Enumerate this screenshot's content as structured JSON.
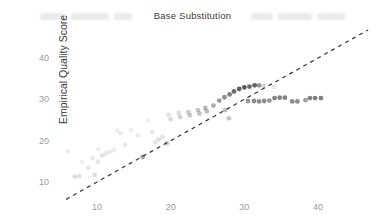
{
  "header": {
    "title": "Base Substitution"
  },
  "axes": {
    "ylabel": "Empirical Quality Score",
    "xlabel": ""
  },
  "colors": {
    "point": "#2f2f2f",
    "identity_line": "#333333",
    "tick_label": "#9a9a9a",
    "title_text": "#3d3d3d",
    "background": "#ffffff"
  },
  "chart_data": {
    "type": "scatter",
    "title": "Base Substitution",
    "xlabel": "",
    "ylabel": "Empirical Quality Score",
    "x_ticks": [
      10,
      20,
      30,
      40
    ],
    "y_ticks": [
      10,
      20,
      30,
      40
    ],
    "xlim": [
      4.5,
      49
    ],
    "ylim": [
      4,
      47
    ],
    "grid": false,
    "legend": "none",
    "identity_line": {
      "style": "dashed",
      "from": [
        5.8,
        5.8
      ],
      "to": [
        46.8,
        46.8
      ]
    },
    "points_format": [
      "predicted_quality",
      "empirical_quality",
      "alpha"
    ],
    "points": [
      [
        6.0,
        17.4,
        0.1
      ],
      [
        7.0,
        11.3,
        0.16
      ],
      [
        7.6,
        11.4,
        0.13
      ],
      [
        8.0,
        14.8,
        0.08
      ],
      [
        8.8,
        13.5,
        0.12
      ],
      [
        9.4,
        15.7,
        0.1
      ],
      [
        9.7,
        11.7,
        0.16
      ],
      [
        10.1,
        14.9,
        0.12
      ],
      [
        10.2,
        18.0,
        0.08
      ],
      [
        10.7,
        16.4,
        0.12
      ],
      [
        11.2,
        16.9,
        0.11
      ],
      [
        11.7,
        17.3,
        0.1
      ],
      [
        12.3,
        17.7,
        0.09
      ],
      [
        12.7,
        22.4,
        0.08
      ],
      [
        13.2,
        21.8,
        0.1
      ],
      [
        13.8,
        19.0,
        0.11
      ],
      [
        14.6,
        22.5,
        0.08
      ],
      [
        15.6,
        21.2,
        0.09
      ],
      [
        16.2,
        16.1,
        0.45
      ],
      [
        17.0,
        24.9,
        0.08
      ],
      [
        17.5,
        22.1,
        0.1
      ],
      [
        17.9,
        19.6,
        0.13
      ],
      [
        18.4,
        20.3,
        0.15
      ],
      [
        18.9,
        20.9,
        0.13
      ],
      [
        19.5,
        19.4,
        0.25
      ],
      [
        19.7,
        26.3,
        0.13
      ],
      [
        20.0,
        25.2,
        0.18
      ],
      [
        21.1,
        26.7,
        0.18
      ],
      [
        21.3,
        25.7,
        0.21
      ],
      [
        22.4,
        26.9,
        0.23
      ],
      [
        22.6,
        26.1,
        0.26
      ],
      [
        23.7,
        27.4,
        0.28
      ],
      [
        23.9,
        26.6,
        0.3
      ],
      [
        24.7,
        27.9,
        0.33
      ],
      [
        24.9,
        27.1,
        0.31
      ],
      [
        25.8,
        28.5,
        0.4
      ],
      [
        26.6,
        29.7,
        0.48
      ],
      [
        27.3,
        30.5,
        0.55
      ],
      [
        27.4,
        27.4,
        0.3
      ],
      [
        27.9,
        25.4,
        0.28
      ],
      [
        28.0,
        31.2,
        0.62
      ],
      [
        28.6,
        31.9,
        0.7
      ],
      [
        29.3,
        32.5,
        0.75
      ],
      [
        30.0,
        32.9,
        0.8
      ],
      [
        30.7,
        33.1,
        0.72
      ],
      [
        31.4,
        33.4,
        0.75
      ],
      [
        32.0,
        33.4,
        0.5
      ],
      [
        32.6,
        33.2,
        0.2
      ],
      [
        34.0,
        33.0,
        0.12
      ],
      [
        30.5,
        29.6,
        0.5
      ],
      [
        31.3,
        29.6,
        0.55
      ],
      [
        32.0,
        29.5,
        0.55
      ],
      [
        32.7,
        29.6,
        0.55
      ],
      [
        33.4,
        29.7,
        0.5
      ],
      [
        34.1,
        30.3,
        0.6
      ],
      [
        34.8,
        30.4,
        0.6
      ],
      [
        35.5,
        30.4,
        0.6
      ],
      [
        36.5,
        29.5,
        0.55
      ],
      [
        37.2,
        29.5,
        0.55
      ],
      [
        38.3,
        29.8,
        0.45
      ],
      [
        38.9,
        30.3,
        0.6
      ],
      [
        39.6,
        30.3,
        0.6
      ],
      [
        40.4,
        30.3,
        0.6
      ]
    ]
  }
}
